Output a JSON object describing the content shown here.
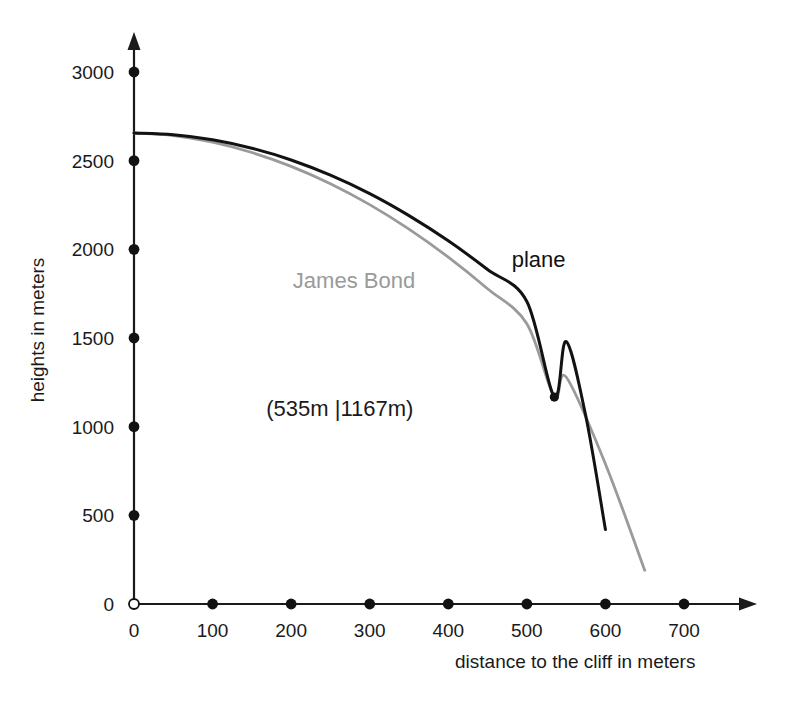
{
  "chart_data": {
    "type": "line",
    "title": "",
    "xlabel": "distance to the cliff in meters",
    "ylabel": "heights in meters",
    "xlim": [
      0,
      740
    ],
    "ylim": [
      0,
      3200
    ],
    "xticks": [
      0,
      100,
      200,
      300,
      400,
      500,
      600,
      700
    ],
    "yticks": [
      0,
      500,
      1000,
      1500,
      2000,
      2500,
      3000
    ],
    "xticklabels": [
      "0",
      "100",
      "200",
      "300",
      "400",
      "500",
      "600",
      "700"
    ],
    "yticklabels": [
      "0",
      "500",
      "1000",
      "1500",
      "2000",
      "2500",
      "3000"
    ],
    "grid": false,
    "legend_position": "inline-labels",
    "origin_label": "0",
    "series": [
      {
        "name": "plane",
        "color": "#121212",
        "label_x": 515,
        "label_y": 1900,
        "x": [
          0,
          50,
          100,
          150,
          200,
          250,
          300,
          350,
          400,
          450,
          500,
          535,
          550,
          575,
          600
        ],
        "y": [
          2656,
          2646,
          2618,
          2570,
          2504,
          2418,
          2314,
          2190,
          2048,
          1886,
          1706,
          1167,
          1480,
          1060,
          420
        ]
      },
      {
        "name": "James Bond",
        "color": "#9a9a9a",
        "label_x": 280,
        "label_y": 1780,
        "x": [
          0,
          50,
          100,
          150,
          200,
          250,
          300,
          350,
          400,
          450,
          500,
          535,
          550,
          600,
          650
        ],
        "y": [
          2656,
          2642,
          2604,
          2546,
          2468,
          2370,
          2252,
          2114,
          1956,
          1778,
          1580,
          1167,
          1280,
          790,
          190
        ]
      }
    ],
    "annotations": [
      {
        "name": "intersection-point",
        "text": "(535m |1167m)",
        "x": 535,
        "y": 1167,
        "label_x": 262,
        "label_y": 1060,
        "marker": true,
        "marker_color": "#121212"
      }
    ]
  },
  "axes": {
    "x_arrow": true,
    "y_arrow": true,
    "origin_marker": "open-circle",
    "tick_marker": "filled-dot"
  }
}
